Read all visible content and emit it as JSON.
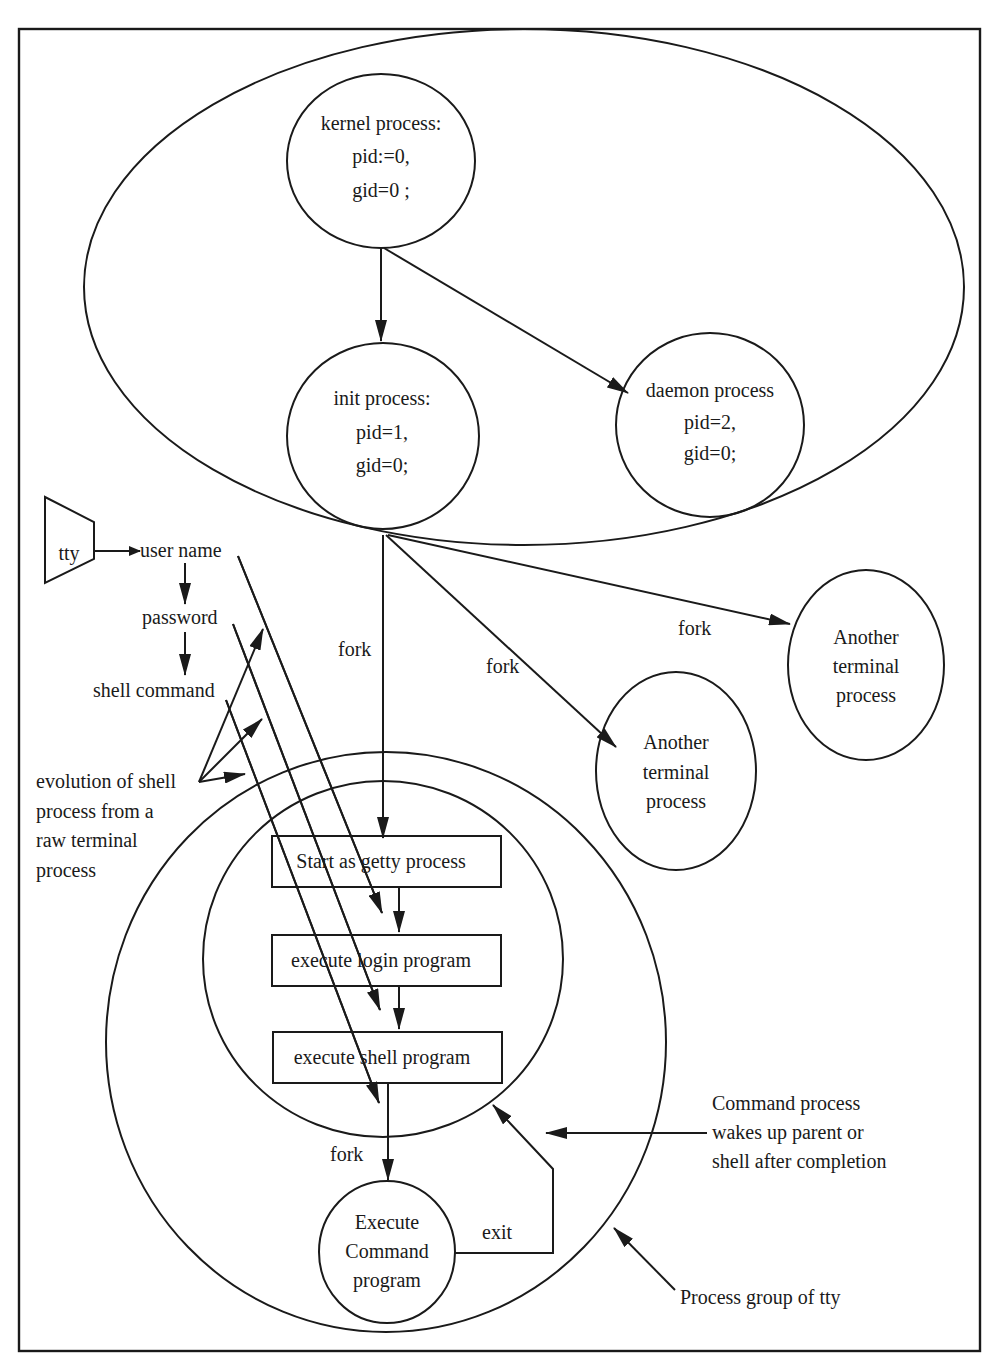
{
  "diagram": {
    "nodes": {
      "kernel": [
        "kernel process:",
        "pid:=0,",
        "gid=0 ;"
      ],
      "init": [
        "init process:",
        "pid=1,",
        "gid=0;"
      ],
      "daemon": [
        "daemon process",
        "pid=2,",
        "gid=0;"
      ],
      "terminal_a": [
        "Another",
        "terminal",
        "process"
      ],
      "terminal_b": [
        "Another",
        "terminal",
        "process"
      ],
      "command": [
        "Execute",
        "Command",
        "program"
      ],
      "tty": "tty"
    },
    "boxes": {
      "getty": "Start as getty process",
      "login": "execute login program",
      "shell": "execute shell program"
    },
    "tty_steps": [
      "user name",
      "password",
      "shell command"
    ],
    "edge_labels": {
      "fork_getty": "fork",
      "fork_terminal_b": "fork",
      "fork_terminal_a": "fork",
      "fork_command": "fork",
      "exit": "exit"
    },
    "annotations": {
      "evolution": [
        "evolution of shell",
        "process from a",
        "raw terminal",
        "process"
      ],
      "wakeup": [
        "Command process",
        "wakes up parent or",
        "shell after completion"
      ],
      "group": "Process group of tty"
    }
  }
}
